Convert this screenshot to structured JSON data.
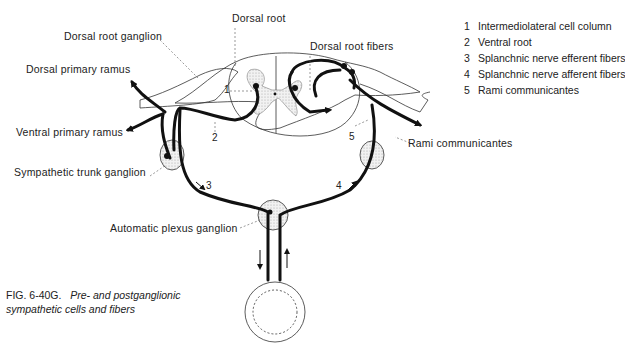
{
  "labels": {
    "dorsal_root": "Dorsal root",
    "dorsal_root_ganglion": "Dorsal root ganglion",
    "dorsal_root_fibers": "Dorsal root fibers",
    "dorsal_primary_ramus": "Dorsal primary ramus",
    "ventral_primary_ramus": "Ventral primary ramus",
    "sympathetic_trunk_ganglion": "Sympathetic trunk ganglion",
    "rami_communicantes": "Rami communicantes",
    "automatic_plexus_ganglion": "Automatic plexus ganglion"
  },
  "numbers": {
    "n1": "1",
    "n2": "2",
    "n3": "3",
    "n4": "4",
    "n5": "5"
  },
  "legend": [
    {
      "num": "1",
      "text": "Intermediolateral cell column"
    },
    {
      "num": "2",
      "text": "Ventral root"
    },
    {
      "num": "3",
      "text": "Splanchnic nerve efferent fibers"
    },
    {
      "num": "4",
      "text": "Splanchnic nerve afferent fibers"
    },
    {
      "num": "5",
      "text": "Rami communicantes"
    }
  ],
  "caption": {
    "fig": "FIG. 6-40G.",
    "line1": "Pre- and postganglionic",
    "line2": "sympathetic cells and fibers"
  }
}
